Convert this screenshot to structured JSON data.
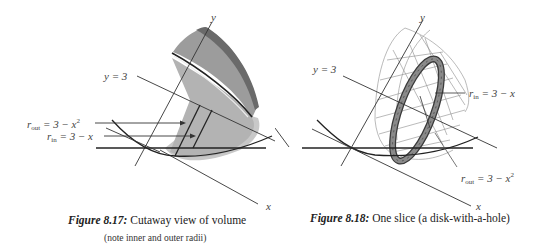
{
  "figures": [
    {
      "id": "8.17",
      "caption_label": "Figure 8.17:",
      "caption_text": "Cutaway view of volume",
      "caption_note": "(note inner and outer radii)",
      "labels": {
        "y_axis": "y",
        "x_axis": "x",
        "line": "y = 3",
        "r_out_base": "r",
        "r_out_sub": "out",
        "r_out_expr": " = 3 − x",
        "r_out_sup": "2",
        "r_in_base": "r",
        "r_in_sub": "in",
        "r_in_expr": " = 3 − x"
      }
    },
    {
      "id": "8.18",
      "caption_label": "Figure 8.18:",
      "caption_text": "One slice (a disk-with-a-hole)",
      "labels": {
        "y_axis": "y",
        "x_axis": "x",
        "line": "y = 3",
        "r_in_base": "r",
        "r_in_sub": "in",
        "r_in_expr": " = 3 − x",
        "r_out_base": "r",
        "r_out_sub": "out",
        "r_out_expr": " = 3 − x",
        "r_out_sup": "2"
      }
    }
  ],
  "colors": {
    "surface_light": "#bdbdbd",
    "surface_mid": "#9a9a9a",
    "surface_dark": "#6e6e6e",
    "rim_dark": "#3a3a3a",
    "washer_fill": "#8a8a8a",
    "line": "#333333",
    "wire": "#8c8c8c"
  }
}
